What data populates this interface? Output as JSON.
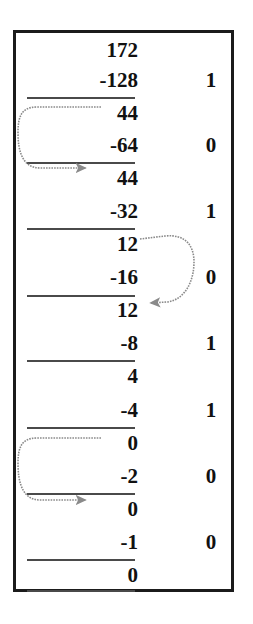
{
  "figure": {
    "frame_color": "#1b1b1b",
    "rule_color": "#4a4a4a",
    "arrow_color": "#8a8a8a",
    "text_color": "#111111"
  },
  "rows": [
    {
      "operand": "172",
      "bit": "",
      "y": 36,
      "rule": false
    },
    {
      "operand": "-128",
      "bit": "1",
      "y": 66,
      "rule": true,
      "rule_y": 97
    },
    {
      "operand": "44",
      "bit": "",
      "y": 99,
      "rule": false
    },
    {
      "operand": "-64",
      "bit": "0",
      "y": 131,
      "rule": true,
      "rule_y": 162
    },
    {
      "operand": "44",
      "bit": "",
      "y": 164,
      "rule": false
    },
    {
      "operand": "-32",
      "bit": "1",
      "y": 197,
      "rule": true,
      "rule_y": 228
    },
    {
      "operand": "12",
      "bit": "",
      "y": 230,
      "rule": false
    },
    {
      "operand": "-16",
      "bit": "0",
      "y": 263,
      "rule": true,
      "rule_y": 295
    },
    {
      "operand": "12",
      "bit": "",
      "y": 296,
      "rule": false
    },
    {
      "operand": "-8",
      "bit": "1",
      "y": 329,
      "rule": true,
      "rule_y": 360
    },
    {
      "operand": "4",
      "bit": "",
      "y": 362,
      "rule": false
    },
    {
      "operand": "-4",
      "bit": "1",
      "y": 396,
      "rule": true,
      "rule_y": 427
    },
    {
      "operand": "0",
      "bit": "",
      "y": 429,
      "rule": false
    },
    {
      "operand": "-2",
      "bit": "0",
      "y": 462,
      "rule": true,
      "rule_y": 493
    },
    {
      "operand": "0",
      "bit": "",
      "y": 495,
      "rule": false
    },
    {
      "operand": "-1",
      "bit": "0",
      "y": 528,
      "rule": true,
      "rule_y": 559
    },
    {
      "operand": "0",
      "bit": "",
      "y": 561,
      "rule": true,
      "rule_y": 590
    }
  ],
  "arrows": [
    {
      "name": "carry-arrow-44-to-44",
      "direction": "left-loop",
      "from_value": "44",
      "to_value": "44"
    },
    {
      "name": "carry-arrow-12-to-12",
      "direction": "right-loop",
      "from_value": "12",
      "to_value": "12"
    },
    {
      "name": "carry-arrow-0-to-0",
      "direction": "left-loop",
      "from_value": "0",
      "to_value": "0"
    }
  ]
}
